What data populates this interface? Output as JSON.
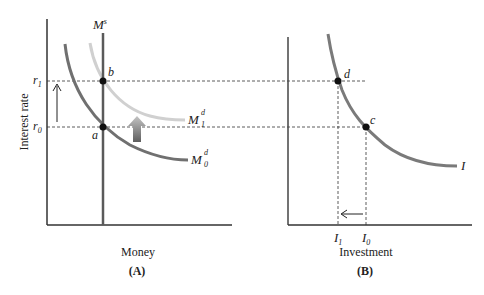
{
  "panel_a": {
    "label": "(A)",
    "x_axis_label": "Money",
    "y_axis_label": "Interest rate",
    "supply_label": "M",
    "supply_sup": "s",
    "demand0_label": "M",
    "demand0_sup": "d",
    "demand0_sub": "0",
    "demand1_label": "M",
    "demand1_sup": "d",
    "demand1_sub": "1",
    "r1_label": "r",
    "r1_sub": "1",
    "r0_label": "r",
    "r0_sub": "0",
    "point_b": "b",
    "point_a": "a"
  },
  "panel_b": {
    "label": "(B)",
    "x_axis_label": "Investment",
    "curve_label": "I",
    "point_d": "d",
    "point_c": "c",
    "i1_label": "I",
    "i1_sub": "1",
    "i0_label": "I",
    "i0_sub": "0"
  },
  "colors": {
    "axis": "#333333",
    "supply": "#555555",
    "demand0": "#6e6e6e",
    "demand1": "#cfcfcf",
    "investment": "#7a7a7a",
    "dashed": "#333333",
    "shift_arrow_top": "#bdbdbd",
    "shift_arrow_bottom": "#6a6a6a"
  }
}
